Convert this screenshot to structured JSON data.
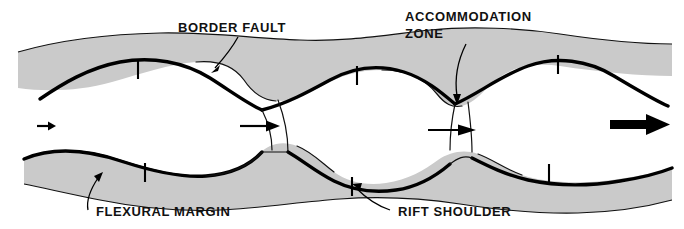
{
  "figure": {
    "kind": "geologic-block-diagram",
    "background_color": "#ffffff",
    "band_color": "#cacaca",
    "line_color": "#111111"
  },
  "labels": {
    "border_fault": "BORDER FAULT",
    "accommodation_zone_line1": "ACCOMMODATION",
    "accommodation_zone_line2": "ZONE",
    "flexural_margin": "FLEXURAL MARGIN",
    "rift_shoulder": "RIFT SHOULDER"
  },
  "icons": {
    "border_fault_leader": "leader-line-icon",
    "accommodation_zone_leader": "leader-arrow-down-icon",
    "flexural_margin_leader": "leader-arrow-up-right-icon",
    "rift_shoulder_leader": "leader-arrow-up-left-icon",
    "extension_arrow_small": "extension-arrow-right-icon",
    "extension_arrow_mid_left": "extension-arrow-right-icon",
    "extension_arrow_mid_right": "extension-arrow-right-icon",
    "extension_arrow_large": "extension-arrow-right-bold-icon",
    "hachure_tick": "fault-hachure-tick-icon"
  },
  "annotations": {
    "extension_direction": "right",
    "hachure_count_upper": 3,
    "hachure_count_lower": 3,
    "basin_count": 3,
    "accommodation_zone_count": 2
  }
}
